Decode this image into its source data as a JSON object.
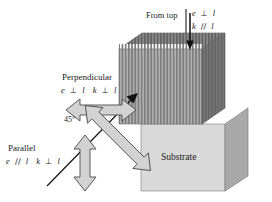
{
  "figure": {
    "type": "physics-schematic"
  },
  "top_annotation": {
    "label": "From top",
    "divider": "vertical-rule",
    "arrow": "down-arrow-icon",
    "formula_1": {
      "field": "e",
      "relation": "⊥",
      "axis": "l"
    },
    "formula_2": {
      "field": "k",
      "relation": "∕∕",
      "axis": "l"
    }
  },
  "perpendicular_annotation": {
    "title": "Perpendicular",
    "formula_1": {
      "field": "e",
      "relation": "⊥",
      "axis": "l"
    },
    "formula_2": {
      "field": "k",
      "relation": "⊥",
      "axis": "l"
    },
    "arrow": "horizontal-double-arrow-icon"
  },
  "parallel_annotation": {
    "title": "Parallel",
    "formula_1": {
      "field": "e",
      "relation": "∕∕",
      "axis": "l"
    },
    "formula_2": {
      "field": "k",
      "relation": "⊥",
      "axis": "l"
    },
    "arrow": "vertical-double-arrow-icon"
  },
  "angle_annotation": {
    "label": "45°",
    "arrow": "diagonal-double-arrow-icon"
  },
  "block": {
    "substrate_label": "Substrate",
    "lamellar_layer": "striped-film",
    "stripe_count": 46,
    "beam": "incident-beam-line"
  },
  "colors": {
    "stripe_dark": "#7e7e7e",
    "stripe_light": "#b4b4b4",
    "film_front_base": "#9a9a9a",
    "top_face": "#6f6f6f",
    "side_face_film": "#6a6a6a",
    "substrate_front": "#d9d9d9",
    "substrate_side": "#a9a9a9",
    "arrow_fill": "#d2d2d2",
    "arrow_stroke": "#4a4a4a",
    "beam": "#111111",
    "text": "#1a1a1a"
  }
}
